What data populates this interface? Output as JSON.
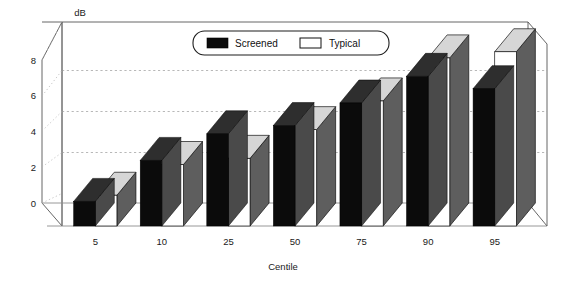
{
  "chart_data": {
    "type": "bar",
    "title": "",
    "subtitle": "",
    "xlabel": "Centile",
    "ylabel": "dB",
    "yunit_label": "dB",
    "categories": [
      "5",
      "10",
      "25",
      "50",
      "75",
      "90",
      "95"
    ],
    "series": [
      {
        "name": "Screened",
        "color": "#0b0b0b",
        "values": [
          1.2,
          3.2,
          4.5,
          4.9,
          6.0,
          7.3,
          6.7
        ]
      },
      {
        "name": "Typical",
        "color": "#ffffff",
        "values": [
          1.5,
          3.0,
          3.3,
          4.7,
          6.1,
          8.2,
          8.5
        ]
      }
    ],
    "ylim": [
      0,
      8
    ],
    "yticks": [
      0,
      2,
      4,
      6,
      8
    ],
    "ytick_labels": [
      "0",
      "2",
      "4",
      "6",
      "8"
    ],
    "xtick_labels": [
      "5",
      "10",
      "25",
      "50",
      "75",
      "90",
      "95"
    ],
    "grid": true,
    "gridlines_at": [
      4,
      6,
      8
    ],
    "legend_position": "top-center",
    "style": "3d-perspective-column",
    "legend_entries": [
      {
        "label": "Screened",
        "swatch": "filled-black"
      },
      {
        "label": "Typical",
        "swatch": "outlined-white"
      }
    ]
  },
  "legend": {
    "screened_label": "Screened",
    "typical_label": "Typical"
  },
  "axes": {
    "y_unit": "dB",
    "x_title": "Centile",
    "y_ticks": [
      "0",
      "2",
      "4",
      "6",
      "8"
    ],
    "x_ticks": [
      "5",
      "10",
      "25",
      "50",
      "75",
      "90",
      "95"
    ]
  }
}
